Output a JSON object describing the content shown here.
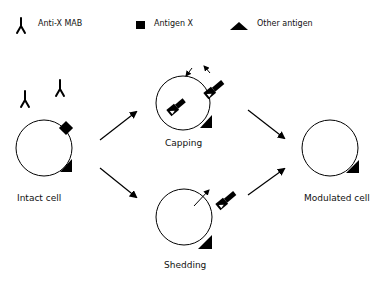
{
  "legend": {
    "items": [
      {
        "icon": "antibody-icon",
        "label": "Anti-X MAB"
      },
      {
        "icon": "square-icon",
        "label": "Antigen X"
      },
      {
        "icon": "triangle-icon",
        "label": "Other antigen"
      }
    ]
  },
  "cells": {
    "intact": {
      "label": "Intact cell"
    },
    "capping": {
      "label": "Capping"
    },
    "shedding": {
      "label": "Shedding"
    },
    "modulated": {
      "label": "Modulated cell"
    }
  },
  "colors": {
    "stroke": "#111111",
    "fill": "#000000",
    "background": "#ffffff"
  }
}
